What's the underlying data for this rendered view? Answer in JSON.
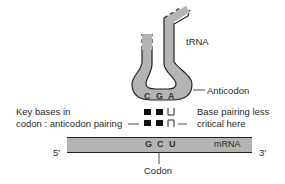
{
  "diagram": {
    "trna_label": "tRNA",
    "anticodon_label": "Anticodon",
    "anticodon_bases": [
      "C",
      "G",
      "A"
    ],
    "key_bases_label_line1": "Key bases in",
    "key_bases_label_line2": "codon : anticodon pairing",
    "less_critical_label_line1": "Base pairing less",
    "less_critical_label_line2": "critical here",
    "mrna_label": "mRNA",
    "codon_bases": [
      "G",
      "C",
      "U"
    ],
    "five_prime": "5′",
    "three_prime": "3′",
    "codon_label": "Codon",
    "colors": {
      "strand_fill": "#b4b4b4",
      "outline": "#222222",
      "square_fill": "#111111"
    }
  }
}
